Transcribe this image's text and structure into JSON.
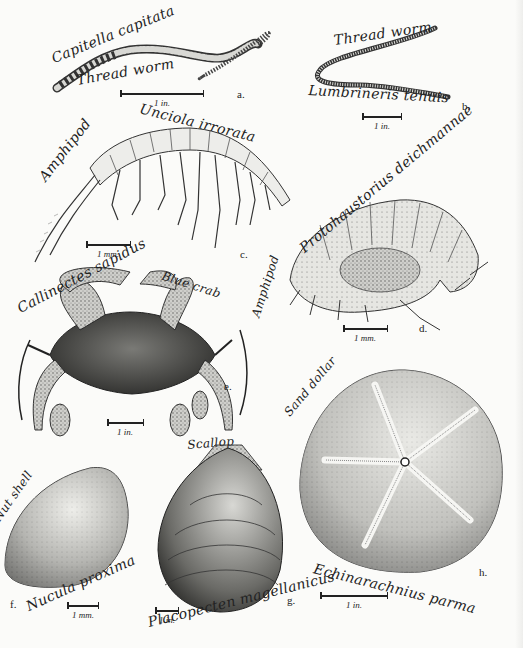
{
  "plate": {
    "background": "#fbfbf9",
    "ink": "#1a1a1a"
  },
  "specimens": [
    {
      "letter": "a.",
      "scientific_name": "Capitella capitata",
      "common_name": "Thread worm",
      "scale": "1 in."
    },
    {
      "letter": "b.",
      "scientific_name": "Lumbrineris tenuis",
      "common_name": "Thread worm",
      "scale": "1 in."
    },
    {
      "letter": "c.",
      "scientific_name": "Unciola irrorata",
      "common_name": "Amphipod",
      "scale": "1 mm."
    },
    {
      "letter": "d.",
      "scientific_name": "Protohaustorius deichmannae",
      "common_name": "Amphipod",
      "scale": "1 mm."
    },
    {
      "letter": "e.",
      "scientific_name": "Callinectes sapidus",
      "common_name": "Blue crab",
      "scale": "1 in."
    },
    {
      "letter": "f.",
      "scientific_name": "Nucula proxima",
      "common_name": "Nut shell",
      "scale": "1 mm."
    },
    {
      "letter": "g.",
      "scientific_name": "Placopecten magellanicus",
      "common_name": "Scallop",
      "scale": "1 in."
    },
    {
      "letter": "h.",
      "scientific_name": "Echinarachnius parma",
      "common_name": "Sand dollar",
      "scale": "1 in."
    }
  ]
}
